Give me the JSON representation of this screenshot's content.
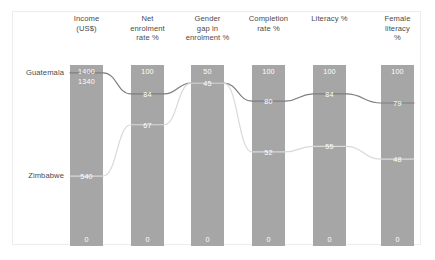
{
  "chart_data": {
    "type": "bar",
    "title": "",
    "subtitle": "",
    "xlabel": "",
    "ylabel": "",
    "grid": false,
    "legend_position": "row-labels-left",
    "categories": [
      "Income (US$)",
      "Net enrolment rate %",
      "Gender gap in enrolment %",
      "Completion rate %",
      "Literacy %",
      "Female literacy %"
    ],
    "axis_ranges": [
      {
        "category": "Income (US$)",
        "min": 0,
        "max": 1400
      },
      {
        "category": "Net enrolment rate %",
        "min": 0,
        "max": 100
      },
      {
        "category": "Gender gap in enrolment %",
        "min": 0,
        "max": 50
      },
      {
        "category": "Completion rate %",
        "min": 0,
        "max": 100
      },
      {
        "category": "Literacy %",
        "min": 0,
        "max": 100
      },
      {
        "category": "Female literacy %",
        "min": 0,
        "max": 100
      }
    ],
    "series": [
      {
        "name": "Guatemala",
        "color": "#7f7f7f",
        "values": [
          1340,
          84,
          45,
          80,
          84,
          79
        ]
      },
      {
        "name": "Zimbabwe",
        "color": "#d9d9d9",
        "values": [
          540,
          67,
          45,
          52,
          55,
          48
        ]
      }
    ],
    "bar_color": "#a6a6a6"
  },
  "columns": [
    {
      "header_lines": [
        "Income",
        "(US$)"
      ],
      "top_label": "1400",
      "bottom_label": "0",
      "marks": [
        {
          "series": "Guatemala",
          "label": "1340",
          "frac": 0.957
        },
        {
          "series": "Zimbabwe",
          "label": "540",
          "frac": 0.386
        }
      ]
    },
    {
      "header_lines": [
        "Net",
        "enrolment",
        "rate %"
      ],
      "top_label": "100",
      "bottom_label": "0",
      "marks": [
        {
          "series": "Guatemala",
          "label": "84",
          "frac": 0.84
        },
        {
          "series": "Zimbabwe",
          "label": "67",
          "frac": 0.67
        }
      ]
    },
    {
      "header_lines": [
        "Gender",
        "gap in",
        "enrolment %"
      ],
      "top_label": "50",
      "bottom_label": "0",
      "marks": [
        {
          "series": "Guatemala",
          "label": "45",
          "frac": 0.9
        },
        {
          "series": "Zimbabwe",
          "label": "45",
          "frac": 0.9
        }
      ]
    },
    {
      "header_lines": [
        "Completion",
        "rate %"
      ],
      "top_label": "100",
      "bottom_label": "0",
      "marks": [
        {
          "series": "Guatemala",
          "label": "80",
          "frac": 0.8
        },
        {
          "series": "Zimbabwe",
          "label": "52",
          "frac": 0.52
        }
      ]
    },
    {
      "header_lines": [
        "Literacy %"
      ],
      "top_label": "100",
      "bottom_label": "0",
      "marks": [
        {
          "series": "Guatemala",
          "label": "84",
          "frac": 0.84
        },
        {
          "series": "Zimbabwe",
          "label": "55",
          "frac": 0.55
        }
      ]
    },
    {
      "header_lines": [
        "Female",
        "literacy",
        "%"
      ],
      "top_label": "100",
      "bottom_label": "0",
      "marks": [
        {
          "series": "Guatemala",
          "label": "79",
          "frac": 0.79
        },
        {
          "series": "Zimbabwe",
          "label": "48",
          "frac": 0.48
        }
      ]
    }
  ],
  "row_labels": [
    {
      "name": "Guatemala",
      "text": "Guatemala"
    },
    {
      "name": "Zimbabwe",
      "text": "Zimbabwe"
    }
  ],
  "colors": {
    "bar": "#a6a6a6",
    "guatemala_line": "#7f7f7f",
    "zimbabwe_line": "#d9d9d9",
    "frame": "#ececec",
    "text": "#4a4a4a",
    "value_text": "#ffffff"
  }
}
